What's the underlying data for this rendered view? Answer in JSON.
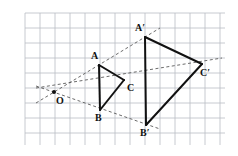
{
  "figure": {
    "canvas": {
      "width": 238,
      "height": 156
    },
    "background_color": "#ffffff"
  },
  "grid": {
    "visible": true,
    "cell_size": 15.0,
    "x_start": 25,
    "x_end": 225,
    "y_start": 13,
    "y_end": 145,
    "line_color": "#b9bcc4",
    "line_width": 0.8
  },
  "style": {
    "solid_stroke_color": "#111111",
    "solid_stroke_width": 2.0,
    "dashed_stroke_color": "#5a5a5a",
    "dashed_stroke_width": 0.9,
    "dash_pattern": "3,2.5",
    "point_color": "#111111",
    "point_radius": 2.0
  },
  "points": [
    {
      "id": "O",
      "label": "O",
      "x": 54,
      "y": 92,
      "label_x": 56,
      "label_y": 96,
      "marked": true
    },
    {
      "id": "A",
      "label": "A",
      "x": 99,
      "y": 65,
      "label_x": 91,
      "label_y": 51,
      "marked": false
    },
    {
      "id": "B",
      "label": "B",
      "x": 100,
      "y": 110,
      "label_x": 95,
      "label_y": 113,
      "marked": false
    },
    {
      "id": "C",
      "label": "C",
      "x": 124,
      "y": 80,
      "label_x": 127,
      "label_y": 83,
      "marked": false
    },
    {
      "id": "A2",
      "label": "A′",
      "x": 145,
      "y": 37,
      "label_x": 135,
      "label_y": 23,
      "marked": false
    },
    {
      "id": "B2",
      "label": "B′",
      "x": 146,
      "y": 125,
      "label_x": 140,
      "label_y": 128,
      "marked": false
    },
    {
      "id": "C2",
      "label": "C′",
      "x": 202,
      "y": 64,
      "label_x": 200,
      "label_y": 68,
      "marked": false
    }
  ],
  "solid_segments": [
    {
      "name": "segment-AB",
      "x1": 99,
      "y1": 65,
      "x2": 100,
      "y2": 110
    },
    {
      "name": "segment-BC",
      "x1": 100,
      "y1": 110,
      "x2": 124,
      "y2": 80
    },
    {
      "name": "segment-CA",
      "x1": 124,
      "y1": 80,
      "x2": 99,
      "y2": 65
    },
    {
      "name": "segment-A2B2",
      "x1": 145,
      "y1": 37,
      "x2": 146,
      "y2": 125
    },
    {
      "name": "segment-B2C2",
      "x1": 146,
      "y1": 125,
      "x2": 202,
      "y2": 64
    },
    {
      "name": "segment-C2A2",
      "x1": 202,
      "y1": 64,
      "x2": 145,
      "y2": 37
    }
  ],
  "dashed_rays": [
    {
      "name": "ray-O-A-A2",
      "x1": 36,
      "y1": 103,
      "x2": 160,
      "y2": 28
    },
    {
      "name": "ray-O-B-B2",
      "x1": 36,
      "y1": 86,
      "x2": 160,
      "y2": 129
    },
    {
      "name": "ray-O-C-C2",
      "x1": 36,
      "y1": 88,
      "x2": 222,
      "y2": 58
    }
  ],
  "annotations": {
    "center_label": "O",
    "prime_symbol": "′",
    "scale_factor_text": "",
    "notes": ""
  }
}
